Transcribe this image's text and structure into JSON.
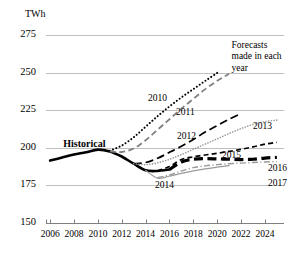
{
  "chart_data": {
    "type": "line",
    "title": "",
    "subtitle": "",
    "xlabel": "",
    "ylabel": "TWh",
    "unit_label": "TWh",
    "xlim": [
      2005.4,
      2025.6
    ],
    "ylim": [
      150,
      275
    ],
    "ytick_labels": [
      "275",
      "250",
      "225",
      "200",
      "175",
      "150"
    ],
    "ytick_values": [
      275,
      250,
      225,
      200,
      175,
      150
    ],
    "xtick_labels": [
      "2006",
      "2008",
      "2010",
      "2012",
      "2014",
      "2016",
      "2018",
      "2020",
      "2022",
      "2024"
    ],
    "xtick_values": [
      2006,
      2008,
      2010,
      2012,
      2014,
      2016,
      2018,
      2020,
      2022,
      2024
    ],
    "grid": true,
    "grid_color": "#bfbfbf",
    "legend_position": "inline-line-labels",
    "annotations": [
      {
        "name": "forecasts-note",
        "lines": [
          "Forecasts",
          "made in each",
          "year"
        ],
        "x": 2021.2,
        "y": 272
      },
      {
        "name": "historical-label",
        "text": "Historical",
        "x": 2007.1,
        "y": 203
      }
    ],
    "series": [
      {
        "name": "Historical",
        "label": "Historical",
        "style": "solid",
        "color": "#000000",
        "width": 2.6,
        "x": [
          2006,
          2007,
          2008,
          2009,
          2010,
          2011,
          2012,
          2013,
          2014,
          2015,
          2016
        ],
        "values": [
          191.5,
          193.5,
          195.5,
          197.0,
          198.8,
          197.6,
          194.2,
          189.4,
          185.0,
          184.6,
          185.6
        ]
      },
      {
        "name": "Forecast 2010",
        "label": "2010",
        "style": "dotted",
        "color": "#000000",
        "width": 2.0,
        "x": [
          2011,
          2012,
          2013,
          2014,
          2015,
          2016,
          2017,
          2018,
          2019,
          2020
        ],
        "values": [
          198.0,
          201.5,
          207.0,
          214.0,
          221.0,
          227.5,
          233.5,
          239.0,
          244.5,
          249.8
        ]
      },
      {
        "name": "Forecast 2011",
        "label": "2011",
        "style": "dashed-medium",
        "color": "#808080",
        "width": 1.8,
        "x": [
          2011,
          2012,
          2013,
          2014,
          2015,
          2016,
          2017,
          2018,
          2019,
          2020,
          2021
        ],
        "values": [
          197.6,
          197.2,
          199.5,
          205.0,
          212.0,
          219.0,
          226.0,
          232.5,
          239.0,
          244.5,
          249.3
        ]
      },
      {
        "name": "Forecast 2012",
        "label": "2012",
        "style": "dashed-long",
        "color": "#000000",
        "width": 1.7,
        "x": [
          2013,
          2014,
          2015,
          2016,
          2017,
          2018,
          2019,
          2020,
          2021,
          2022
        ],
        "values": [
          189.4,
          190.2,
          193.0,
          197.0,
          201.0,
          205.5,
          210.5,
          214.8,
          219.0,
          222.8
        ]
      },
      {
        "name": "Forecast 2013",
        "label": "2013",
        "style": "dotted-fine",
        "color": "#9a9a9a",
        "width": 1.6,
        "x": [
          2013,
          2014,
          2015,
          2016,
          2017,
          2018,
          2019,
          2020,
          2021,
          2022,
          2023,
          2024,
          2025
        ],
        "values": [
          189.4,
          188.8,
          190.0,
          192.4,
          195.5,
          199.0,
          202.5,
          206.0,
          209.5,
          212.8,
          215.5,
          217.4,
          218.4
        ]
      },
      {
        "name": "Forecast 2014",
        "label": "2014",
        "style": "solid-thin",
        "color": "#9a9a9a",
        "width": 1.2,
        "x": [
          2014,
          2015,
          2016,
          2017,
          2018,
          2019,
          2020,
          2021
        ],
        "values": [
          185.0,
          179.8,
          181.2,
          183.0,
          184.6,
          186.0,
          187.2,
          188.2
        ]
      },
      {
        "name": "Forecast 2015",
        "label": "2015",
        "style": "dashed-short",
        "color": "#000000",
        "width": 1.7,
        "x": [
          2015,
          2016,
          2017,
          2018,
          2019,
          2020,
          2021,
          2022,
          2023,
          2024,
          2025
        ],
        "values": [
          184.6,
          187.5,
          192.2,
          194.0,
          195.2,
          196.4,
          197.6,
          199.0,
          200.6,
          202.4,
          203.6
        ]
      },
      {
        "name": "Forecast 2016",
        "label": "2016",
        "style": "dashed-thick",
        "color": "#000000",
        "width": 3.2,
        "x": [
          2016,
          2017,
          2018,
          2019,
          2020,
          2021,
          2022,
          2023,
          2024,
          2025
        ],
        "values": [
          185.6,
          190.6,
          192.4,
          192.8,
          192.6,
          192.4,
          192.2,
          192.4,
          193.2,
          193.6
        ]
      },
      {
        "name": "Forecast 2017",
        "label": "2017",
        "style": "dash-dot",
        "color": "#9a9a9a",
        "width": 1.4,
        "x": [
          2015,
          2016,
          2017,
          2018,
          2019,
          2020,
          2021,
          2022,
          2023,
          2024,
          2025
        ],
        "values": [
          180.2,
          182.0,
          184.6,
          186.8,
          188.0,
          188.8,
          189.4,
          189.8,
          190.2,
          190.6,
          190.8
        ]
      }
    ],
    "series_label_positions": [
      {
        "name": "label-2010",
        "label": "2010",
        "x": 148,
        "y": 93
      },
      {
        "name": "label-2011",
        "label": "2011",
        "x": 176,
        "y": 107
      },
      {
        "name": "label-2012",
        "label": "2012",
        "x": 177,
        "y": 131
      },
      {
        "name": "label-2013",
        "label": "2013",
        "x": 253,
        "y": 121
      },
      {
        "name": "label-2014",
        "label": "2014",
        "x": 155,
        "y": 180
      },
      {
        "name": "label-2015",
        "label": "2015",
        "x": 222,
        "y": 150
      },
      {
        "name": "label-2016",
        "label": "2016",
        "x": 268,
        "y": 163
      },
      {
        "name": "label-2017",
        "label": "2017",
        "x": 268,
        "y": 178
      }
    ]
  },
  "plot": {
    "left": 43,
    "right": 284,
    "top": 35,
    "bottom": 223
  }
}
